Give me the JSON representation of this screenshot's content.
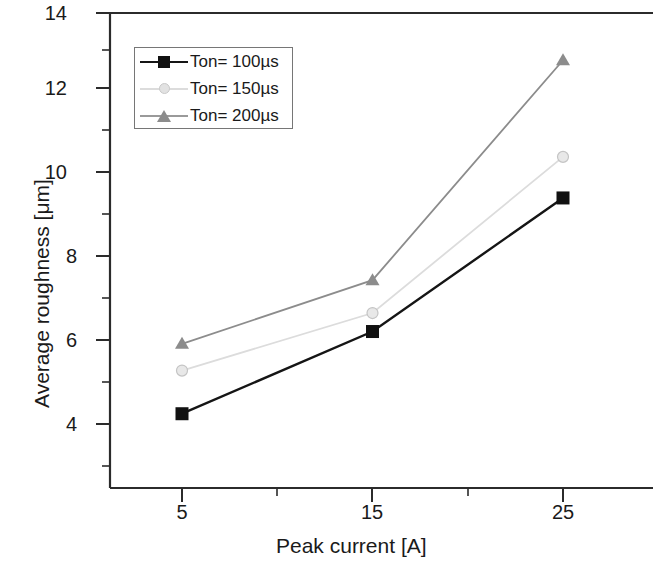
{
  "chart": {
    "title": "",
    "xlabel": "Peak current [A]",
    "ylabel": "Average roughness [μm]",
    "xtick_labels": [
      "5",
      "15",
      "25"
    ],
    "ytick_labels": [
      "4",
      "6",
      "8",
      "10",
      "12",
      "14"
    ]
  },
  "legend": {
    "entries": [
      {
        "label": "Ton= 100µs",
        "color": "#111111",
        "marker": "square"
      },
      {
        "label": "Ton= 150µs",
        "color": "#d8d8d8",
        "marker": "circle"
      },
      {
        "label": "Ton= 200µs",
        "color": "#8c8c8c",
        "marker": "triangle"
      }
    ]
  },
  "chart_data": {
    "type": "line",
    "title": "",
    "xlabel": "Peak current [A]",
    "ylabel": "Average roughness [μm]",
    "x": [
      5,
      15,
      25
    ],
    "categories": [
      "5",
      "15",
      "25"
    ],
    "xlim": [
      0,
      30
    ],
    "ylim": [
      3,
      14
    ],
    "xticks": [
      5,
      15,
      25
    ],
    "yticks": [
      4,
      6,
      8,
      10,
      12,
      14
    ],
    "minor_ticks": true,
    "grid": false,
    "legend_position": "upper left",
    "series": [
      {
        "name": "Ton= 100µs",
        "values": [
          4.25,
          6.25,
          9.5
        ],
        "color": "#111111",
        "marker": "square",
        "linestyle": "solid"
      },
      {
        "name": "Ton= 150µs",
        "values": [
          5.3,
          6.7,
          10.5
        ],
        "color": "#d8d8d8",
        "marker": "circle",
        "linestyle": "solid"
      },
      {
        "name": "Ton= 200µs",
        "values": [
          5.95,
          7.5,
          12.85
        ],
        "color": "#8c8c8c",
        "marker": "triangle",
        "linestyle": "solid"
      }
    ]
  }
}
